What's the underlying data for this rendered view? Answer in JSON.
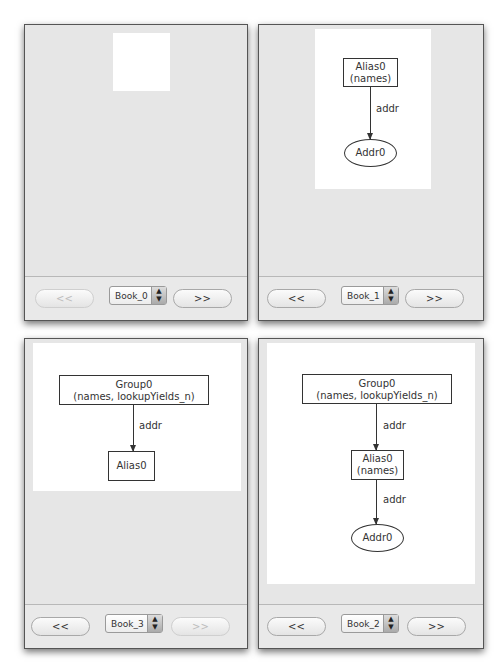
{
  "page": {
    "header_left": "",
    "header_right": ""
  },
  "panels": [
    {
      "id": "top-left",
      "nav": {
        "prev_label": "<<",
        "next_label": ">>",
        "prev_enabled": false,
        "next_enabled": true,
        "selected": "Book_0"
      },
      "graph": {
        "nodes": [],
        "edges": []
      }
    },
    {
      "id": "top-right",
      "nav": {
        "prev_label": "<<",
        "next_label": ">>",
        "prev_enabled": true,
        "next_enabled": true,
        "selected": "Book_1"
      },
      "graph": {
        "nodes": [
          {
            "id": "Alias0",
            "line1": "Alias0",
            "line2": "(names)",
            "shape": "box"
          },
          {
            "id": "Addr0",
            "line1": "Addr0",
            "shape": "ellipse"
          }
        ],
        "edges": [
          {
            "from": "Alias0",
            "to": "Addr0",
            "label": "addr"
          }
        ]
      }
    },
    {
      "id": "bottom-left",
      "nav": {
        "prev_label": "<<",
        "next_label": ">>",
        "prev_enabled": true,
        "next_enabled": false,
        "selected": "Book_3"
      },
      "graph": {
        "nodes": [
          {
            "id": "Group0",
            "line1": "Group0",
            "line2": "(names, lookupYields_n)",
            "shape": "box"
          },
          {
            "id": "Alias0",
            "line1": "Alias0",
            "shape": "box"
          }
        ],
        "edges": [
          {
            "from": "Group0",
            "to": "Alias0",
            "label": "addr"
          }
        ]
      }
    },
    {
      "id": "bottom-right",
      "nav": {
        "prev_label": "<<",
        "next_label": ">>",
        "prev_enabled": true,
        "next_enabled": true,
        "selected": "Book_2"
      },
      "graph": {
        "nodes": [
          {
            "id": "Group0",
            "line1": "Group0",
            "line2": "(names, lookupYields_n)",
            "shape": "box"
          },
          {
            "id": "Alias0",
            "line1": "Alias0",
            "line2": "(names)",
            "shape": "box"
          },
          {
            "id": "Addr0",
            "line1": "Addr0",
            "shape": "ellipse"
          }
        ],
        "edges": [
          {
            "from": "Group0",
            "to": "Alias0",
            "label": "addr"
          },
          {
            "from": "Alias0",
            "to": "Addr0",
            "label": "addr"
          }
        ]
      }
    }
  ]
}
